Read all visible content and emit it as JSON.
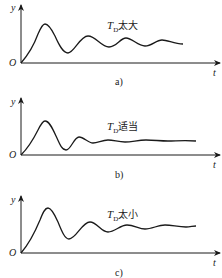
{
  "figure": {
    "panels": [
      {
        "id": "a",
        "caption": "a)",
        "label_T": "T",
        "label_sub": "D",
        "label_text": "太大",
        "y_axis_label": "y",
        "x_axis_label": "t",
        "origin_label": "O",
        "description": "Derivative time too large: slow-decaying oscillation"
      },
      {
        "id": "b",
        "caption": "b)",
        "label_T": "T",
        "label_sub": "D",
        "label_text": "适当",
        "y_axis_label": "y",
        "x_axis_label": "t",
        "origin_label": "O",
        "description": "Derivative time appropriate: quickly settles"
      },
      {
        "id": "c",
        "caption": "c)",
        "label_T": "T",
        "label_sub": "D",
        "label_text": "太小",
        "y_axis_label": "y",
        "x_axis_label": "t",
        "origin_label": "O",
        "description": "Derivative time too small: larger overshoot, moderate oscillation"
      }
    ],
    "colors": {
      "line": "#1a1a1a",
      "background": "#ffffff"
    }
  }
}
